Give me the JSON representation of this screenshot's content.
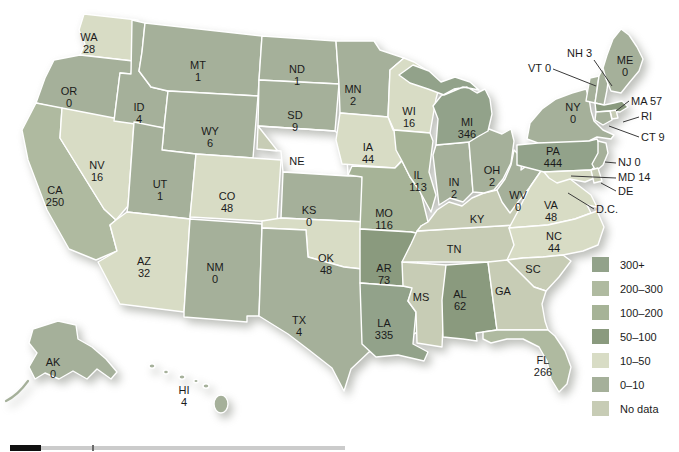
{
  "palette": {
    "300plus": "#92a28a",
    "200-300": "#afbaa0",
    "100-200": "#a6b397",
    "50-100": "#8a9a7e",
    "10-50": "#d8dcc5",
    "0-10": "#a5b09a",
    "nodata": "#c7ccb5"
  },
  "legend": [
    {
      "label": "300+",
      "category": "300plus"
    },
    {
      "label": "200–300",
      "category": "200-300"
    },
    {
      "label": "100–200",
      "category": "100-200"
    },
    {
      "label": "50–100",
      "category": "50-100"
    },
    {
      "label": "10–50",
      "category": "10-50"
    },
    {
      "label": "0–10",
      "category": "0-10"
    },
    {
      "label": "No data",
      "category": "nodata"
    }
  ],
  "states": [
    {
      "id": "WA",
      "abbr": "WA",
      "value": "28",
      "category": "10-50"
    },
    {
      "id": "OR",
      "abbr": "OR",
      "value": "0",
      "category": "0-10"
    },
    {
      "id": "CA",
      "abbr": "CA",
      "value": "250",
      "category": "200-300"
    },
    {
      "id": "NV",
      "abbr": "NV",
      "value": "16",
      "category": "10-50"
    },
    {
      "id": "ID",
      "abbr": "ID",
      "value": "4",
      "category": "0-10"
    },
    {
      "id": "MT",
      "abbr": "MT",
      "value": "1",
      "category": "0-10"
    },
    {
      "id": "WY",
      "abbr": "WY",
      "value": "6",
      "category": "0-10"
    },
    {
      "id": "UT",
      "abbr": "UT",
      "value": "1",
      "category": "0-10"
    },
    {
      "id": "CO",
      "abbr": "CO",
      "value": "48",
      "category": "10-50"
    },
    {
      "id": "AZ",
      "abbr": "AZ",
      "value": "32",
      "category": "10-50"
    },
    {
      "id": "NM",
      "abbr": "NM",
      "value": "0",
      "category": "0-10"
    },
    {
      "id": "ND",
      "abbr": "ND",
      "value": "1",
      "category": "0-10"
    },
    {
      "id": "SD",
      "abbr": "SD",
      "value": "9",
      "category": "0-10"
    },
    {
      "id": "NE",
      "abbr": "NE",
      "value": null,
      "category": "nodata"
    },
    {
      "id": "KS",
      "abbr": "KS",
      "value": "0",
      "category": "0-10"
    },
    {
      "id": "OK",
      "abbr": "OK",
      "value": "48",
      "category": "10-50"
    },
    {
      "id": "TX",
      "abbr": "TX",
      "value": "4",
      "category": "0-10"
    },
    {
      "id": "MN",
      "abbr": "MN",
      "value": "2",
      "category": "0-10"
    },
    {
      "id": "IA",
      "abbr": "IA",
      "value": "44",
      "category": "10-50"
    },
    {
      "id": "MO",
      "abbr": "MO",
      "value": "116",
      "category": "100-200"
    },
    {
      "id": "AR",
      "abbr": "AR",
      "value": "73",
      "category": "50-100"
    },
    {
      "id": "LA",
      "abbr": "LA",
      "value": "335",
      "category": "300plus"
    },
    {
      "id": "WI",
      "abbr": "WI",
      "value": "16",
      "category": "10-50"
    },
    {
      "id": "IL",
      "abbr": "IL",
      "value": "113",
      "category": "100-200"
    },
    {
      "id": "IN",
      "abbr": "IN",
      "value": "2",
      "category": "0-10"
    },
    {
      "id": "MI",
      "abbr": "MI",
      "value": "346",
      "category": "300plus"
    },
    {
      "id": "OH",
      "abbr": "OH",
      "value": "2",
      "category": "0-10"
    },
    {
      "id": "KY",
      "abbr": "KY",
      "value": null,
      "category": "nodata"
    },
    {
      "id": "TN",
      "abbr": "TN",
      "value": null,
      "category": "nodata"
    },
    {
      "id": "MS",
      "abbr": "MS",
      "value": null,
      "category": "nodata"
    },
    {
      "id": "AL",
      "abbr": "AL",
      "value": "62",
      "category": "50-100"
    },
    {
      "id": "GA",
      "abbr": "GA",
      "value": null,
      "category": "nodata"
    },
    {
      "id": "SC",
      "abbr": "SC",
      "value": null,
      "category": "nodata"
    },
    {
      "id": "NC",
      "abbr": "NC",
      "value": "44",
      "category": "10-50"
    },
    {
      "id": "VA",
      "abbr": "VA",
      "value": "48",
      "category": "10-50"
    },
    {
      "id": "WV",
      "abbr": "WV",
      "value": "0",
      "category": "0-10"
    },
    {
      "id": "FL",
      "abbr": "FL",
      "value": "266",
      "category": "200-300"
    },
    {
      "id": "PA",
      "abbr": "PA",
      "value": "444",
      "category": "300plus"
    },
    {
      "id": "NY",
      "abbr": "NY",
      "value": "0",
      "category": "0-10"
    },
    {
      "id": "VT",
      "abbr": "VT",
      "value": "0",
      "category": "0-10"
    },
    {
      "id": "NH",
      "abbr": "NH",
      "value": "3",
      "category": "0-10"
    },
    {
      "id": "ME",
      "abbr": "ME",
      "value": "0",
      "category": "0-10"
    },
    {
      "id": "MA",
      "abbr": "MA",
      "value": "57",
      "category": "50-100"
    },
    {
      "id": "RI",
      "abbr": "RI",
      "value": null,
      "category": "nodata"
    },
    {
      "id": "CT",
      "abbr": "CT",
      "value": "9",
      "category": "0-10"
    },
    {
      "id": "NJ",
      "abbr": "NJ",
      "value": "0",
      "category": "0-10"
    },
    {
      "id": "MD",
      "abbr": "MD",
      "value": "14",
      "category": "10-50"
    },
    {
      "id": "DE",
      "abbr": "DE",
      "value": null,
      "category": "nodata"
    },
    {
      "id": "DC",
      "abbr": "D.C.",
      "value": null,
      "category": "nodata"
    },
    {
      "id": "AK",
      "abbr": "AK",
      "value": "0",
      "category": "0-10"
    },
    {
      "id": "HI",
      "abbr": "HI",
      "value": "4",
      "category": "0-10"
    }
  ]
}
